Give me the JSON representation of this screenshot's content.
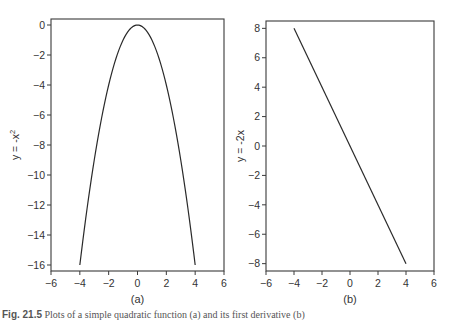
{
  "figure": {
    "caption_prefix": "Fig. 21.5",
    "caption_text": "Plots of a simple quadratic function (a) and its first derivative (b)"
  },
  "chart_data": [
    {
      "type": "line",
      "panel_label": "(a)",
      "title": "",
      "xlabel": "",
      "ylabel": "y = -x",
      "ylabel_superscript": "2",
      "xlim": [
        -6,
        6
      ],
      "ylim": [
        -16.4,
        0.4
      ],
      "xticks": [
        -6,
        -4,
        -2,
        0,
        2,
        4,
        6
      ],
      "yticks": [
        0,
        -2,
        -4,
        -6,
        -8,
        -10,
        -12,
        -14,
        -16
      ],
      "grid": false,
      "legend": null,
      "series": [
        {
          "name": "y = -x^2",
          "x": [
            -4,
            -3.5,
            -3,
            -2.5,
            -2,
            -1.5,
            -1,
            -0.5,
            0,
            0.5,
            1,
            1.5,
            2,
            2.5,
            3,
            3.5,
            4
          ],
          "y": [
            -16,
            -12.25,
            -9,
            -6.25,
            -4,
            -2.25,
            -1,
            -0.25,
            0,
            -0.25,
            -1,
            -2.25,
            -4,
            -6.25,
            -9,
            -12.25,
            -16
          ]
        }
      ]
    },
    {
      "type": "line",
      "panel_label": "(b)",
      "title": "",
      "xlabel": "",
      "ylabel": "y = -2x",
      "xlim": [
        -6,
        6
      ],
      "ylim": [
        -8.5,
        8.5
      ],
      "xticks": [
        -6,
        -4,
        -2,
        0,
        2,
        4,
        6
      ],
      "yticks": [
        8,
        6,
        4,
        2,
        0,
        -2,
        -4,
        -6,
        -8
      ],
      "grid": false,
      "legend": null,
      "series": [
        {
          "name": "y = -2x",
          "x": [
            -4,
            4
          ],
          "y": [
            8,
            -8
          ]
        }
      ]
    }
  ]
}
